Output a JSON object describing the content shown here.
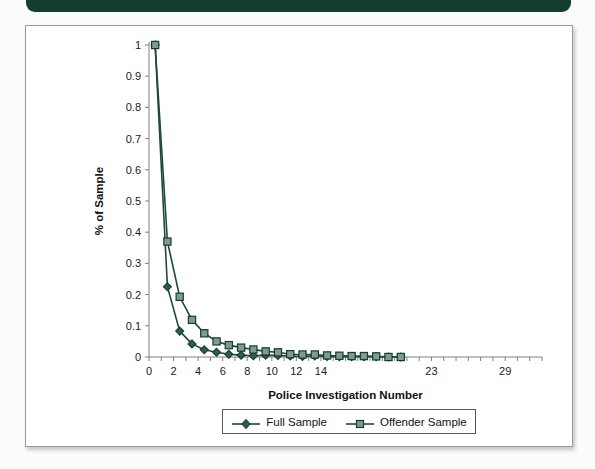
{
  "page": {
    "background_color": "#fbfbfa",
    "accent_bar_color": "#143d30",
    "card_background": "#ffffff",
    "series_color": "#20493c"
  },
  "chart_data": {
    "type": "line",
    "title": "",
    "xlabel": "Police Investigation Number",
    "ylabel": "% of Sample",
    "xlim": [
      0,
      32
    ],
    "ylim": [
      0,
      1
    ],
    "grid": false,
    "legend_position": "bottom",
    "x_tick_labels": [
      "0",
      "2",
      "4",
      "6",
      "8",
      "10",
      "12",
      "14",
      "23",
      "29"
    ],
    "x_tick_positions": [
      0,
      2,
      4,
      6,
      8,
      10,
      12,
      14,
      23,
      29
    ],
    "y_tick_labels": [
      "0",
      "0.1",
      "0.2",
      "0.3",
      "0.4",
      "0.5",
      "0.6",
      "0.7",
      "0.8",
      "0.9",
      "1"
    ],
    "y_tick_values": [
      0,
      0.1,
      0.2,
      0.3,
      0.4,
      0.5,
      0.6,
      0.7,
      0.8,
      0.9,
      1
    ],
    "x": [
      0.5,
      1.5,
      2.5,
      3.5,
      4.5,
      5.5,
      6.5,
      7.5,
      8.5,
      9.5,
      10.5,
      11.5,
      12.5,
      13.5,
      14.5,
      15.5,
      16.5,
      17.5,
      18.5,
      19.5,
      20.5
    ],
    "series": [
      {
        "name": "Full Sample",
        "marker": "diamond",
        "values": [
          1.0,
          0.225,
          0.083,
          0.042,
          0.023,
          0.015,
          0.009,
          0.006,
          0.004,
          0.006,
          0.005,
          0.003,
          0.002,
          0.003,
          0.002,
          0.001,
          0.001,
          0.001,
          0.001,
          0.0,
          0.0
        ]
      },
      {
        "name": "Offender Sample",
        "marker": "square",
        "values": [
          1.0,
          0.37,
          0.193,
          0.119,
          0.076,
          0.05,
          0.038,
          0.03,
          0.024,
          0.018,
          0.015,
          0.009,
          0.008,
          0.008,
          0.005,
          0.004,
          0.003,
          0.003,
          0.002,
          0.0,
          0.0
        ]
      }
    ]
  },
  "legend": {
    "entries": [
      {
        "label": "Full Sample",
        "marker": "diamond"
      },
      {
        "label": "Offender Sample",
        "marker": "square"
      }
    ]
  }
}
